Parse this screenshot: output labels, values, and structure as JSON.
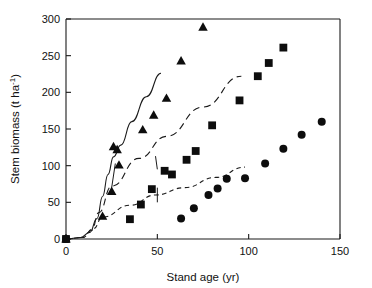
{
  "chart_data": {
    "type": "scatter",
    "title": "",
    "subtitle": "",
    "xlabel": "Stand age (yr)",
    "ylabel": "Stem biomass (t ha",
    "ylabel_superscript": "-1",
    "ylabel_suffix": ")",
    "xlim": [
      0,
      150
    ],
    "ylim": [
      0,
      300
    ],
    "xticks": [
      0,
      50,
      100,
      150
    ],
    "yticks": [
      0,
      50,
      100,
      150,
      200,
      250,
      300
    ],
    "xtick_labels": [
      "0",
      "50",
      "100",
      "150"
    ],
    "ytick_labels": [
      "0",
      "50",
      "100",
      "150",
      "200",
      "250",
      "300"
    ],
    "grid": false,
    "legend": "none",
    "marker_color": "#0d0d0d",
    "axis_color": "#1a1a1a",
    "series": [
      {
        "name": "Triangles",
        "marker": "triangle",
        "fit_style": "solid",
        "points": [
          {
            "x": 0,
            "y": 0
          },
          {
            "x": 20,
            "y": 31
          },
          {
            "x": 25,
            "y": 65
          },
          {
            "x": 29,
            "y": 101
          },
          {
            "x": 26,
            "y": 126
          },
          {
            "x": 28,
            "y": 122
          },
          {
            "x": 42,
            "y": 149
          },
          {
            "x": 48,
            "y": 169
          },
          {
            "x": 55,
            "y": 192
          },
          {
            "x": 63,
            "y": 243
          },
          {
            "x": 75,
            "y": 289
          }
        ],
        "fit_points": [
          {
            "x": 0,
            "y": 0
          },
          {
            "x": 8,
            "y": 2
          },
          {
            "x": 13,
            "y": 9
          },
          {
            "x": 17,
            "y": 28
          },
          {
            "x": 20,
            "y": 58
          },
          {
            "x": 23,
            "y": 88
          },
          {
            "x": 26,
            "y": 112
          },
          {
            "x": 30,
            "y": 128
          },
          {
            "x": 36,
            "y": 160
          },
          {
            "x": 44,
            "y": 194
          },
          {
            "x": 52,
            "y": 226
          }
        ],
        "notch": [
          {
            "x": 27,
            "y": 103
          },
          {
            "x": 25,
            "y": 70
          }
        ]
      },
      {
        "name": "Squares",
        "marker": "square",
        "fit_style": "long-dash",
        "points": [
          {
            "x": 0,
            "y": 0
          },
          {
            "x": 35,
            "y": 27
          },
          {
            "x": 41,
            "y": 47
          },
          {
            "x": 47,
            "y": 68
          },
          {
            "x": 54,
            "y": 93
          },
          {
            "x": 58,
            "y": 88
          },
          {
            "x": 66,
            "y": 108
          },
          {
            "x": 71,
            "y": 120
          },
          {
            "x": 80,
            "y": 155
          },
          {
            "x": 95,
            "y": 189
          },
          {
            "x": 105,
            "y": 222
          },
          {
            "x": 111,
            "y": 240
          },
          {
            "x": 119,
            "y": 261
          }
        ],
        "fit_points": [
          {
            "x": 0,
            "y": 0
          },
          {
            "x": 9,
            "y": 2
          },
          {
            "x": 14,
            "y": 12
          },
          {
            "x": 18,
            "y": 36
          },
          {
            "x": 25,
            "y": 72
          },
          {
            "x": 40,
            "y": 110
          },
          {
            "x": 55,
            "y": 140
          },
          {
            "x": 75,
            "y": 180
          },
          {
            "x": 96,
            "y": 222
          }
        ],
        "notch": [
          {
            "x": 49,
            "y": 113
          },
          {
            "x": 50,
            "y": 95
          }
        ]
      },
      {
        "name": "Circles",
        "marker": "circle",
        "fit_style": "short-dash",
        "points": [
          {
            "x": 0,
            "y": 0
          },
          {
            "x": 63,
            "y": 28
          },
          {
            "x": 70,
            "y": 42
          },
          {
            "x": 78,
            "y": 60
          },
          {
            "x": 83,
            "y": 69
          },
          {
            "x": 88,
            "y": 82
          },
          {
            "x": 98,
            "y": 83
          },
          {
            "x": 109,
            "y": 103
          },
          {
            "x": 119,
            "y": 123
          },
          {
            "x": 129,
            "y": 142
          },
          {
            "x": 140,
            "y": 160
          }
        ],
        "fit_points": [
          {
            "x": 0,
            "y": 0
          },
          {
            "x": 9,
            "y": 2
          },
          {
            "x": 15,
            "y": 14
          },
          {
            "x": 20,
            "y": 30
          },
          {
            "x": 35,
            "y": 46
          },
          {
            "x": 49,
            "y": 60
          },
          {
            "x": 65,
            "y": 70
          },
          {
            "x": 82,
            "y": 84
          },
          {
            "x": 98,
            "y": 98
          }
        ],
        "notch": [
          {
            "x": 50,
            "y": 70
          },
          {
            "x": 50,
            "y": 50
          }
        ]
      }
    ]
  }
}
